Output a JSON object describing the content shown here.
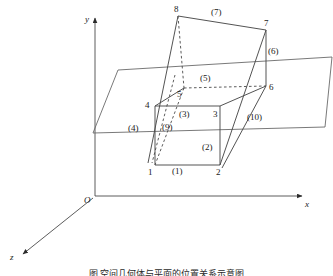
{
  "figure": {
    "axes": {
      "origin_label": "O",
      "x_label": "x",
      "y_label": "y",
      "z_label": "z"
    },
    "vertex_labels": [
      {
        "id": "v1",
        "text": "1",
        "x": 148,
        "y": 168
      },
      {
        "id": "v2",
        "text": "2",
        "x": 216,
        "y": 168
      },
      {
        "id": "v3",
        "text": "3",
        "x": 213,
        "y": 110
      },
      {
        "id": "v4",
        "text": "4",
        "x": 145,
        "y": 101
      },
      {
        "id": "v5",
        "text": "5",
        "x": 177,
        "y": 90
      },
      {
        "id": "v6",
        "text": "6",
        "x": 265,
        "y": 83
      },
      {
        "id": "v7",
        "text": "7",
        "x": 262,
        "y": 22
      },
      {
        "id": "v8",
        "text": "8",
        "x": 174,
        "y": 6
      }
    ],
    "edge_labels": [
      {
        "id": "e1",
        "text": "(1)",
        "x": 173,
        "y": 168
      },
      {
        "id": "e2",
        "text": "(2)",
        "x": 203,
        "y": 144
      },
      {
        "id": "e3",
        "text": "(3)",
        "x": 178,
        "y": 110
      },
      {
        "id": "e4",
        "text": "(4)",
        "x": 130,
        "y": 125
      },
      {
        "id": "e5",
        "text": "(5)",
        "x": 200,
        "y": 75
      },
      {
        "id": "e6",
        "text": "(6)",
        "x": 267,
        "y": 49
      },
      {
        "id": "e7",
        "text": "(7)",
        "x": 212,
        "y": 10
      },
      {
        "id": "e9",
        "text": "(9)",
        "x": 163,
        "y": 124
      },
      {
        "id": "e10",
        "text": "(10)",
        "x": 247,
        "y": 114
      }
    ],
    "caption": "图  空间几何体与平面的位置关系示意图",
    "colors": {
      "stroke": "#4a4a4a",
      "plane_stroke": "#5a5a5a",
      "dashed": "#3f3f3f",
      "text": "#1a1a1a",
      "background": "#ffffff"
    }
  }
}
